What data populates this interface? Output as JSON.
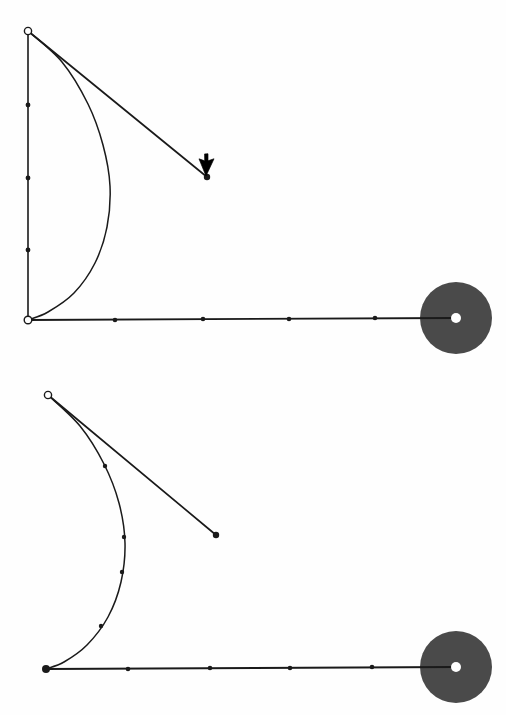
{
  "canvas": {
    "width": 506,
    "height": 715,
    "background": "#fefefe"
  },
  "colors": {
    "stroke": "#1a1a1a",
    "disk_fill": "#4a4a4a",
    "node_open_fill": "#ffffff",
    "node_solid_fill": "#1a1a1a",
    "hub_dot_fill": "#ffffff",
    "cursor_fill": "#000000"
  },
  "chart_data": {
    "type": "line",
    "title": "",
    "subtitle": "",
    "xlabel": "",
    "ylabel": "",
    "grid": false,
    "legend": "none",
    "xlim": [
      0,
      506
    ],
    "ylim": [
      0,
      715
    ],
    "panels": [
      {
        "name": "upper-panel",
        "label": "upper pendulum diagram",
        "pivot": {
          "x": 28,
          "y": 31,
          "marker": "open-circle"
        },
        "ground_anchor": {
          "x": 28,
          "y": 320,
          "marker": "open-circle"
        },
        "hub": {
          "x": 456,
          "y": 318,
          "radius": 36,
          "center_dot_radius": 5
        },
        "vertical_segment": {
          "x1": 28,
          "y1": 31,
          "x2": 28,
          "y2": 320,
          "tick_points": [
            {
              "x": 28,
              "y": 105
            },
            {
              "x": 28,
              "y": 178
            },
            {
              "x": 28,
              "y": 250
            }
          ]
        },
        "horizontal_segment": {
          "x1": 28,
          "y1": 320,
          "x2": 456,
          "y2": 318,
          "tick_points": [
            {
              "x": 115,
              "y": 320
            },
            {
              "x": 203,
              "y": 319
            },
            {
              "x": 289,
              "y": 319
            },
            {
              "x": 375,
              "y": 318
            }
          ]
        },
        "diagonal_segment": {
          "x1": 28,
          "y1": 31,
          "x2": 207,
          "y2": 177,
          "end_marker": "solid-dot"
        },
        "curve": {
          "name": "deflected-beam",
          "points": [
            {
              "x": 28,
              "y": 31
            },
            {
              "x": 62,
              "y": 62
            },
            {
              "x": 88,
              "y": 104
            },
            {
              "x": 103,
              "y": 145
            },
            {
              "x": 110,
              "y": 186
            },
            {
              "x": 107,
              "y": 227
            },
            {
              "x": 95,
              "y": 263
            },
            {
              "x": 74,
              "y": 293
            },
            {
              "x": 48,
              "y": 312
            },
            {
              "x": 28,
              "y": 320
            }
          ]
        },
        "cursor": {
          "x": 206,
          "y": 176,
          "kind": "arrow-pointer",
          "rotation": 205
        }
      },
      {
        "name": "lower-panel",
        "label": "lower pendulum diagram",
        "pivot": {
          "x": 48,
          "y": 395,
          "marker": "open-circle"
        },
        "ground_anchor": {
          "x": 46,
          "y": 669,
          "marker": "solid-dot"
        },
        "hub": {
          "x": 456,
          "y": 667,
          "radius": 36,
          "center_dot_radius": 5
        },
        "vertical_segment": null,
        "horizontal_segment": {
          "x1": 46,
          "y1": 669,
          "x2": 456,
          "y2": 667,
          "tick_points": [
            {
              "x": 128,
              "y": 669
            },
            {
              "x": 210,
              "y": 668
            },
            {
              "x": 290,
              "y": 668
            },
            {
              "x": 372,
              "y": 667
            }
          ]
        },
        "diagonal_segment": {
          "x1": 48,
          "y1": 395,
          "x2": 216,
          "y2": 535,
          "end_marker": "solid-dot"
        },
        "curve": {
          "name": "deflected-beam",
          "points": [
            {
              "x": 48,
              "y": 395
            },
            {
              "x": 80,
              "y": 426
            },
            {
              "x": 104,
              "y": 464
            },
            {
              "x": 119,
              "y": 503
            },
            {
              "x": 125,
              "y": 543
            },
            {
              "x": 121,
              "y": 582
            },
            {
              "x": 108,
              "y": 617
            },
            {
              "x": 87,
              "y": 645
            },
            {
              "x": 64,
              "y": 662
            },
            {
              "x": 46,
              "y": 669
            }
          ],
          "tick_points": [
            {
              "x": 105,
              "y": 466
            },
            {
              "x": 124,
              "y": 537
            },
            {
              "x": 122,
              "y": 572
            },
            {
              "x": 101,
              "y": 626
            }
          ]
        }
      }
    ]
  }
}
